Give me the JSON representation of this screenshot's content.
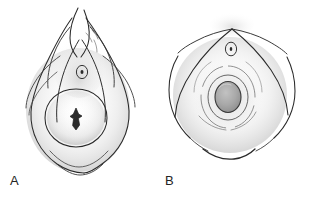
{
  "figure": {
    "type": "line-illustration",
    "background_color": "#ffffff",
    "stroke_color": "#1f1f1f",
    "shading_color": "#b9b9b9",
    "width": 317,
    "height": 202,
    "panel_count": 2,
    "panels": [
      {
        "id": "A",
        "label": "A",
        "label_position": {
          "x": 10,
          "y": 174
        },
        "center": {
          "x": 79,
          "y": 95
        },
        "description": "teardrop-shaped contour with converging apex folds, small ring aperture above a large rounded oval containing a vertical star-shaped slit",
        "features": [
          {
            "name": "apex-fold",
            "shape": "converging-curves"
          },
          {
            "name": "small-ring-aperture",
            "cx": 82,
            "cy": 72,
            "rx": 5.5,
            "ry": 6.5
          },
          {
            "name": "central-dot",
            "cx": 82,
            "cy": 72,
            "r": 1.4
          },
          {
            "name": "large-oval-ring",
            "cx": 76,
            "cy": 118,
            "rx": 31,
            "ry": 29
          },
          {
            "name": "star-slit",
            "cx": 76,
            "cy": 119,
            "height": 20
          },
          {
            "name": "outer-contour",
            "shape": "teardrop"
          }
        ]
      },
      {
        "id": "B",
        "label": "B",
        "label_position": {
          "x": 165,
          "y": 174
        },
        "center": {
          "x": 232,
          "y": 93
        },
        "description": "peaked apex with radiating flanks, small ring aperture, and a gray-filled central oval surrounded by concentric rings, with a detached arc below",
        "features": [
          {
            "name": "apex-peak",
            "x": 232,
            "y": 28
          },
          {
            "name": "small-ring-aperture",
            "cx": 231,
            "cy": 49,
            "rx": 5.5,
            "ry": 6.5
          },
          {
            "name": "central-filled-oval",
            "cx": 228,
            "cy": 97,
            "rx": 13,
            "ry": 15,
            "fill": "#a8a8a8"
          },
          {
            "name": "concentric-ring-inner",
            "cx": 228,
            "cy": 97,
            "rx": 19,
            "ry": 22
          },
          {
            "name": "concentric-ring-outer",
            "cx": 228,
            "cy": 97,
            "rx": 27,
            "ry": 30
          },
          {
            "name": "lower-arc",
            "cx": 226,
            "cy": 154
          }
        ]
      }
    ]
  },
  "colors": {
    "stroke": "#1f1f1f",
    "stroke_light": "#4a4a4a",
    "shading_mid": "#b9b9b9",
    "shading_light": "#dedede",
    "fill_gray": "#a8a8a8",
    "fill_gray_dark": "#8f8f8f",
    "background": "#ffffff",
    "label_text": "#242424"
  }
}
